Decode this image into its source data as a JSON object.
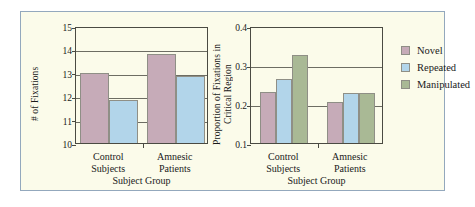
{
  "figure": {
    "background_color": "#fbfbea",
    "border_color": "#93a8bd"
  },
  "colors": {
    "novel": "#c6abb8",
    "repeated": "#b2d5ea",
    "manipulated": "#a9b995",
    "axis": "#4a4a42",
    "grid": "#6d6d63",
    "text": "#1a1a1a"
  },
  "legend": {
    "position": "right",
    "items": [
      {
        "label": "Novel",
        "color": "#c6abb8"
      },
      {
        "label": "Repeated",
        "color": "#b2d5ea"
      },
      {
        "label": "Manipulated",
        "color": "#a9b995"
      }
    ]
  },
  "chart_data": [
    {
      "type": "bar",
      "title": "",
      "xlabel": "Subject Group",
      "ylabel": "# of Fixations",
      "categories": [
        "Control Subjects",
        "Amnesic Patients"
      ],
      "category_lines": [
        [
          "Control",
          "Subjects"
        ],
        [
          "Amnesic",
          "Patients"
        ]
      ],
      "ylim": [
        10,
        15
      ],
      "yticks": [
        10,
        11,
        12,
        13,
        14,
        15
      ],
      "ytick_labels": [
        "10",
        "11",
        "12",
        "13",
        "14",
        "15"
      ],
      "grid": true,
      "series": [
        {
          "name": "Novel",
          "color": "#c6abb8",
          "values": [
            13.0,
            13.8
          ]
        },
        {
          "name": "Repeated",
          "color": "#b2d5ea",
          "values": [
            11.85,
            12.85
          ]
        }
      ]
    },
    {
      "type": "bar",
      "title": "",
      "xlabel": "Subject Group",
      "ylabel": "Proportion of Fixations in Critical Region",
      "ylabel_lines": [
        "Proportion of Fixations in",
        "Critical Region"
      ],
      "categories": [
        "Control Subjects",
        "Amnesic Patients"
      ],
      "category_lines": [
        [
          "Control",
          "Subjects"
        ],
        [
          "Amnesic",
          "Patients"
        ]
      ],
      "ylim": [
        0.1,
        0.4
      ],
      "yticks": [
        0.1,
        0.2,
        0.3,
        0.4
      ],
      "ytick_labels": [
        "0.1",
        "0.2",
        "0.3",
        "0.4"
      ],
      "grid": true,
      "series": [
        {
          "name": "Novel",
          "color": "#c6abb8",
          "values": [
            0.23,
            0.205
          ]
        },
        {
          "name": "Repeated",
          "color": "#b2d5ea",
          "values": [
            0.265,
            0.228
          ]
        },
        {
          "name": "Manipulated",
          "color": "#a9b995",
          "values": [
            0.325,
            0.228
          ]
        }
      ]
    }
  ]
}
